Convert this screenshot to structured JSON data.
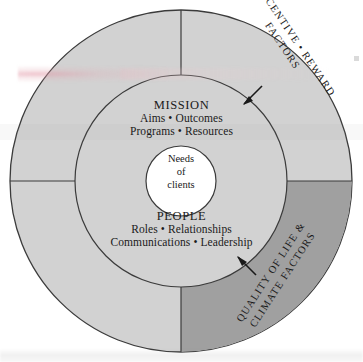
{
  "diagram": {
    "center": {
      "lines": [
        "Needs",
        "of",
        "clients"
      ]
    },
    "inner_top": {
      "heading": "MISSION",
      "line1": "Aims  •  Outcomes",
      "line2": "Programs  •  Resources"
    },
    "inner_bottom": {
      "heading": "PEOPLE",
      "line1": "Roles  •  Relationships",
      "line2": "Communications  •  Leadership"
    },
    "outer_labels": {
      "top_right_line1": "INCENTIVE • REWARD",
      "top_right_line2": "FACTORS",
      "bottom_right_line1": "QUALITY OF LIFE &",
      "bottom_right_line2": "CLIMATE FACTORS"
    },
    "colors": {
      "page_background": "#ffffff",
      "outer_ring_light": "#d2d2d2",
      "outer_ring_dark": "#a0a0a0",
      "inner_circle": "#d2d2d2",
      "center_circle": "#ffffff",
      "stroke": "#3b3b3b",
      "text": "#1a1a1a",
      "highlighter_pink": "#e296a5"
    },
    "geometry": {
      "center_x": 181,
      "center_y": 181,
      "outer_radius": 171,
      "inner_radius": 106,
      "core_radius": 35
    }
  }
}
